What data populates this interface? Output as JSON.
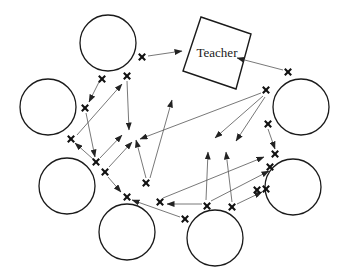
{
  "diagram": {
    "teacher": {
      "label": "Teacher",
      "corners": [
        [
          201,
          17
        ],
        [
          251,
          34
        ],
        [
          236,
          89
        ],
        [
          183,
          71
        ]
      ],
      "label_pos": [
        217,
        57
      ]
    },
    "students": [
      {
        "id": "s1",
        "cx": 108,
        "cy": 43,
        "r": 28
      },
      {
        "id": "s2",
        "cx": 48,
        "cy": 107,
        "r": 28
      },
      {
        "id": "s3",
        "cx": 67,
        "cy": 186,
        "r": 28
      },
      {
        "id": "s4",
        "cx": 127,
        "cy": 232,
        "r": 28
      },
      {
        "id": "s5",
        "cx": 215,
        "cy": 238,
        "r": 28
      },
      {
        "id": "s6",
        "cx": 293,
        "cy": 187,
        "r": 28
      },
      {
        "id": "s7",
        "cx": 301,
        "cy": 107,
        "r": 28
      }
    ],
    "crosses": [
      [
        142,
        57
      ],
      [
        102,
        79
      ],
      [
        127,
        76
      ],
      [
        85,
        108
      ],
      [
        71,
        139
      ],
      [
        96,
        162
      ],
      [
        105,
        172
      ],
      [
        146,
        183
      ],
      [
        127,
        197
      ],
      [
        160,
        202
      ],
      [
        207,
        206
      ],
      [
        232,
        207
      ],
      [
        185,
        219
      ],
      [
        257,
        190
      ],
      [
        270,
        167
      ],
      [
        275,
        154
      ],
      [
        266,
        189
      ],
      [
        268,
        124
      ],
      [
        266,
        90
      ],
      [
        288,
        72
      ]
    ],
    "arrows": [
      {
        "from": [
          148,
          56
        ],
        "to": [
          182,
          51
        ]
      },
      {
        "from": [
          283,
          70
        ],
        "to": [
          237,
          58
        ]
      },
      {
        "from": [
          99,
          82
        ],
        "to": [
          89,
          102
        ]
      },
      {
        "from": [
          77,
          135
        ],
        "to": [
          122,
          84
        ]
      },
      {
        "from": [
          127,
          81
        ],
        "to": [
          129,
          130
        ]
      },
      {
        "from": [
          86,
          113
        ],
        "to": [
          95,
          157
        ]
      },
      {
        "from": [
          93,
          159
        ],
        "to": [
          75,
          143
        ]
      },
      {
        "from": [
          100,
          158
        ],
        "to": [
          122,
          135
        ]
      },
      {
        "from": [
          109,
          167
        ],
        "to": [
          132,
          142
        ]
      },
      {
        "from": [
          108,
          177
        ],
        "to": [
          121,
          192
        ]
      },
      {
        "from": [
          146,
          178
        ],
        "to": [
          136,
          140
        ]
      },
      {
        "from": [
          150,
          178
        ],
        "to": [
          172,
          100
        ]
      },
      {
        "from": [
          261,
          93
        ],
        "to": [
          140,
          139
        ]
      },
      {
        "from": [
          263,
          96
        ],
        "to": [
          215,
          138
        ]
      },
      {
        "from": [
          265,
          97
        ],
        "to": [
          236,
          141
        ]
      },
      {
        "from": [
          268,
          129
        ],
        "to": [
          275,
          149
        ]
      },
      {
        "from": [
          202,
          204
        ],
        "to": [
          167,
          204
        ]
      },
      {
        "from": [
          206,
          200
        ],
        "to": [
          208,
          152
        ]
      },
      {
        "from": [
          232,
          202
        ],
        "to": [
          226,
          152
        ]
      },
      {
        "from": [
          211,
          201
        ],
        "to": [
          269,
          171
        ]
      },
      {
        "from": [
          163,
          198
        ],
        "to": [
          264,
          157
        ]
      },
      {
        "from": [
          237,
          204
        ],
        "to": [
          262,
          192
        ]
      },
      {
        "from": [
          180,
          217
        ],
        "to": [
          132,
          200
        ]
      }
    ]
  }
}
